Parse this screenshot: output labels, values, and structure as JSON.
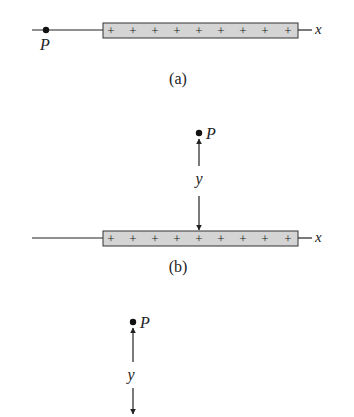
{
  "figure": {
    "colors": {
      "ink": "#222222",
      "bar_fill": "#d4d4d4",
      "bar_stroke": "#333333",
      "background": "#ffffff"
    },
    "panels": [
      {
        "id": "a",
        "caption": "(a)",
        "axis_label": "x",
        "point_label": "P",
        "charges": [
          "+",
          "+",
          "+",
          "+",
          "+",
          "+",
          "+",
          "+",
          "+"
        ],
        "point_position": "on x-axis, left of charged rod"
      },
      {
        "id": "b",
        "caption": "(b)",
        "axis_label": "x",
        "point_label": "P",
        "distance_label": "y",
        "charges": [
          "+",
          "+",
          "+",
          "+",
          "+",
          "+",
          "+",
          "+",
          "+"
        ],
        "point_position": "above center of charged rod at distance y"
      },
      {
        "id": "c",
        "point_label": "P",
        "distance_label": "y",
        "point_position": "above left end of rod at distance y (cropped)"
      }
    ]
  }
}
